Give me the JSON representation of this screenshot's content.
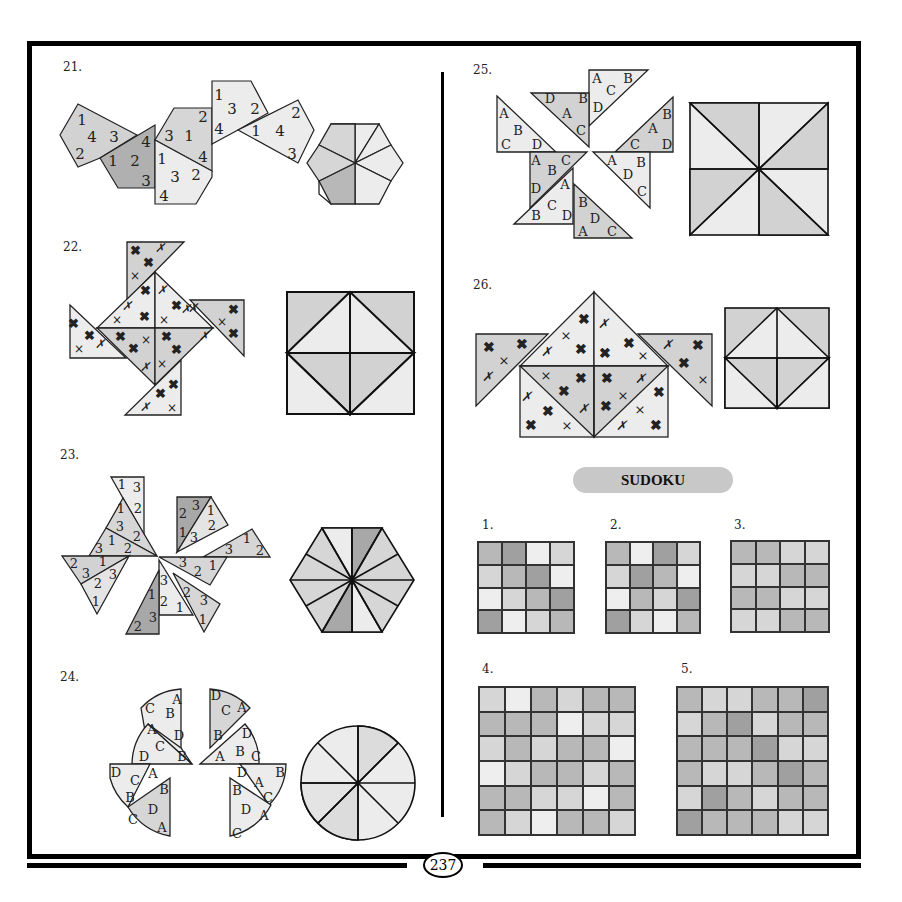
{
  "page": {
    "page_number": "237",
    "colors": {
      "light": "#ececec",
      "mid": "#d2d2d2",
      "dark": "#a8a8a8",
      "border": "#000000"
    }
  },
  "puzzles": [
    {
      "number": "21.",
      "type": "hexagon-numbers",
      "piece_labels": [
        [
          "1",
          "4",
          "3",
          "2"
        ],
        [
          "1",
          "2",
          "3",
          "4"
        ],
        [
          "3",
          "1",
          "2",
          "4"
        ],
        [
          "1",
          "3",
          "2",
          "4"
        ],
        [
          "2",
          "1",
          "4",
          "3"
        ],
        [
          "1",
          "3",
          "2",
          "4"
        ]
      ]
    },
    {
      "number": "22.",
      "type": "square-crosses",
      "symbols": [
        "bold-cross",
        "thin-x",
        "italic-x"
      ]
    },
    {
      "number": "23.",
      "type": "hexagon-12-triangles",
      "piece_labels": [
        [
          "1",
          "3",
          "2"
        ],
        [
          "1",
          "3",
          "2"
        ],
        [
          "3",
          "1",
          "2"
        ],
        [
          "2",
          "3",
          "1"
        ],
        [
          "2",
          "3",
          "1"
        ],
        [
          "1",
          "2",
          "3"
        ],
        [
          "3",
          "2",
          "1"
        ],
        [
          "3",
          "1",
          "2"
        ],
        [
          "3",
          "2",
          "1"
        ],
        [
          "2",
          "3",
          "1"
        ],
        [
          "1",
          "3",
          "2"
        ]
      ]
    },
    {
      "number": "24.",
      "type": "circle-letters",
      "piece_labels": [
        [
          "C",
          "B",
          "A",
          "D"
        ],
        [
          "D",
          "C",
          "A",
          "B"
        ],
        [
          "A",
          "D",
          "C",
          "B"
        ],
        [
          "D",
          "B",
          "A",
          "C"
        ],
        [
          "D",
          "C",
          "A",
          "B"
        ],
        [
          "D",
          "A",
          "B",
          "C"
        ],
        [
          "C",
          "D",
          "A",
          "B"
        ],
        [
          "B",
          "D",
          "C",
          "A"
        ]
      ]
    },
    {
      "number": "25.",
      "type": "square-letters",
      "piece_labels": [
        [
          "A",
          "B",
          "C",
          "D"
        ],
        [
          "D",
          "A",
          "B",
          "C"
        ],
        [
          "A",
          "C",
          "B",
          "D"
        ],
        [
          "B",
          "A",
          "C",
          "D"
        ],
        [
          "A",
          "B",
          "C",
          "D"
        ],
        [
          "A",
          "B",
          "D",
          "C"
        ],
        [
          "B",
          "C",
          "D",
          "A"
        ],
        [
          "B",
          "D",
          "A",
          "C"
        ]
      ]
    },
    {
      "number": "26.",
      "type": "square-crosses",
      "symbols": [
        "bold-cross",
        "thin-x",
        "italic-x"
      ]
    }
  ],
  "sudoku": {
    "title": "SUDOKU",
    "grids": [
      {
        "number": "1.",
        "size": 4,
        "cells": [
          [
            2,
            3,
            0,
            1
          ],
          [
            1,
            2,
            3,
            0
          ],
          [
            0,
            1,
            2,
            3
          ],
          [
            3,
            0,
            1,
            2
          ]
        ]
      },
      {
        "number": "2.",
        "size": 4,
        "cells": [
          [
            2,
            0,
            3,
            1
          ],
          [
            1,
            3,
            2,
            0
          ],
          [
            0,
            2,
            1,
            3
          ],
          [
            3,
            1,
            0,
            2
          ]
        ]
      },
      {
        "number": "3.",
        "size": 4,
        "cells": [
          [
            2,
            2,
            1,
            1
          ],
          [
            1,
            1,
            2,
            2
          ],
          [
            2,
            2,
            1,
            1
          ],
          [
            1,
            1,
            2,
            2
          ]
        ]
      },
      {
        "number": "4.",
        "size": 6,
        "cells": [
          [
            1,
            0,
            2,
            1,
            2,
            2
          ],
          [
            2,
            2,
            2,
            0,
            1,
            1
          ],
          [
            1,
            2,
            1,
            2,
            2,
            0
          ],
          [
            0,
            1,
            2,
            2,
            1,
            2
          ],
          [
            2,
            2,
            1,
            1,
            0,
            2
          ],
          [
            2,
            1,
            0,
            2,
            2,
            1
          ]
        ]
      },
      {
        "number": "5.",
        "size": 6,
        "cells": [
          [
            2,
            1,
            1,
            2,
            2,
            3
          ],
          [
            1,
            2,
            3,
            1,
            2,
            2
          ],
          [
            2,
            2,
            2,
            3,
            1,
            1
          ],
          [
            2,
            1,
            1,
            2,
            3,
            2
          ],
          [
            1,
            3,
            2,
            1,
            2,
            2
          ],
          [
            3,
            2,
            2,
            2,
            1,
            1
          ]
        ]
      }
    ],
    "shades": [
      "#eeeeee",
      "#d6d6d6",
      "#b8b8b8",
      "#a0a0a0"
    ]
  }
}
